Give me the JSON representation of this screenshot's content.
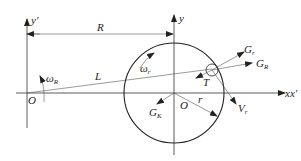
{
  "diagram": {
    "type": "kinematic-schematic",
    "axes": {
      "left_vertical": "y'",
      "right_vertical": "y",
      "horizontal": "xx'"
    },
    "labels": {
      "y_prime": "y'",
      "y_main": "y",
      "R": "R",
      "omega_R_main": "ω",
      "omega_R_sub": "R",
      "L": "L",
      "O_left": "O",
      "omega_r_main": "ω",
      "omega_r_sub": "r",
      "G_r_main": "G",
      "G_r_sub": "r",
      "G_R_main": "G",
      "G_R_sub": "R",
      "T": "T",
      "xx_prime": "xx'",
      "G_K_main": "G",
      "G_K_sub": "K",
      "O_center": "O",
      "r": "r",
      "V_r_main": "V",
      "V_r_sub": "r"
    },
    "colors": {
      "stroke": "#333333",
      "text": "#222222",
      "background": "#ffffff"
    }
  }
}
